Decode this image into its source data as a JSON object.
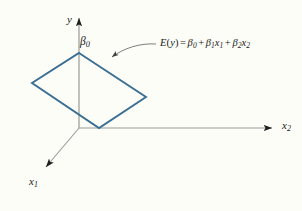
{
  "figure": {
    "type": "3d-coordinate-plane-diagram",
    "background_color": "#fdfdf7",
    "plane_stroke_color": "#3a6f93",
    "axis_stroke_color": "#8a8a8a",
    "leader_stroke_color": "#6b6b6b",
    "text_color": "#1a1a1a"
  },
  "axes": {
    "y": {
      "label": "y",
      "origin": [
        79,
        128
      ],
      "tip": [
        79,
        14
      ],
      "arrowhead": true
    },
    "x2": {
      "label_base": "x",
      "label_sub": "2",
      "origin": [
        79,
        128
      ],
      "tip": [
        278,
        128
      ],
      "arrowhead": true
    },
    "x1": {
      "label_base": "x",
      "label_sub": "1",
      "origin": [
        79,
        128
      ],
      "tip": [
        42,
        172
      ],
      "arrowhead": true
    }
  },
  "intercept": {
    "label_base": "β",
    "label_sub": "0"
  },
  "plane": {
    "name": "regression-response-plane",
    "vertices": [
      [
        79,
        53
      ],
      [
        146,
        97
      ],
      [
        99,
        128
      ],
      [
        32,
        83
      ]
    ],
    "closed": true
  },
  "equation": {
    "lhs_function": "E",
    "lhs_open": "(",
    "lhs_var": "y",
    "lhs_close": ")",
    "equals": "=",
    "term0_base": "β",
    "term0_sub": "0",
    "plus1": "+",
    "term1_coef": "β",
    "term1_coef_sub": "1",
    "term1_var": "x",
    "term1_var_sub": "1",
    "plus2": "+",
    "term2_coef": "β",
    "term2_coef_sub": "2",
    "term2_var": "x",
    "term2_var_sub": "2"
  },
  "leader": {
    "name": "equation-pointer",
    "from": [
      156,
      44
    ],
    "to": [
      101,
      64
    ],
    "arrowhead": true
  }
}
